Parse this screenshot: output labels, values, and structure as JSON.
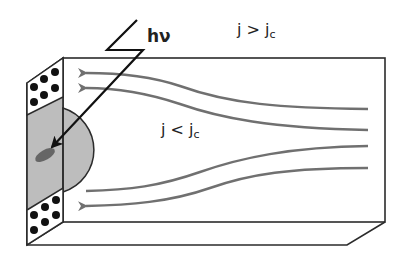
{
  "diagram": {
    "labels": {
      "photon": "hν",
      "outer_region": "j > j",
      "outer_region_sub": "c",
      "inner_region": "j < j",
      "inner_region_sub": "c"
    },
    "colors": {
      "outline": "#2b2b2b",
      "streamline": "#707070",
      "hotspot_fill": "#bdbdbd",
      "spot_fill": "#666666",
      "dot_fill": "#111111",
      "background": "#ffffff"
    },
    "streamlines": {
      "count": 4,
      "direction": "right-to-left"
    },
    "contact_dots_per_patch": 6
  }
}
